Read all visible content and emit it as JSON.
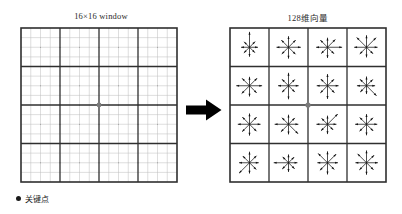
{
  "figure": {
    "title_left": "16×16 window",
    "title_right": "128维向量"
  },
  "legend": {
    "marker": "keypoint-dot",
    "label": "关键点"
  },
  "arrow": {
    "name": "transform-arrow",
    "direction": "right",
    "color": "#111111"
  },
  "colors": {
    "grid_fine": "#bdbdbd",
    "grid_block": "#2f2f2f",
    "panel_border": "#2f2f2f",
    "keypoint": "#7a7a7a",
    "ink": "#111111",
    "background": "#ffffff"
  },
  "window_grid": {
    "name": "16x16-sampling-window",
    "fine_cells": 16,
    "block_cells": 4,
    "keypoint": {
      "x": 0.5,
      "y": 0.5
    }
  },
  "descriptor_grid": {
    "name": "4x4-orientation-histogram-grid",
    "rows": 4,
    "cols": 4,
    "bins_per_cell": 8,
    "bin_angles_deg": [
      90,
      45,
      0,
      315,
      270,
      225,
      180,
      135
    ],
    "keypoint": {
      "x": 0.5,
      "y": 0.5
    },
    "cells": [
      {
        "row": 0,
        "col": 0,
        "magnitudes": [
          1.0,
          0.52,
          0.55,
          0.5,
          0.62,
          0.52,
          0.55,
          0.5
        ]
      },
      {
        "row": 0,
        "col": 1,
        "magnitudes": [
          0.72,
          0.66,
          0.8,
          0.64,
          0.74,
          0.62,
          0.78,
          0.66
        ]
      },
      {
        "row": 0,
        "col": 2,
        "magnitudes": [
          0.62,
          0.72,
          0.95,
          0.6,
          0.7,
          0.58,
          0.74,
          0.66
        ]
      },
      {
        "row": 0,
        "col": 3,
        "magnitudes": [
          0.78,
          0.88,
          0.72,
          0.6,
          0.66,
          0.62,
          0.8,
          0.9
        ]
      },
      {
        "row": 1,
        "col": 0,
        "magnitudes": [
          0.58,
          0.7,
          0.82,
          0.66,
          0.7,
          0.72,
          0.86,
          0.68
        ]
      },
      {
        "row": 1,
        "col": 1,
        "magnitudes": [
          0.84,
          0.58,
          0.66,
          0.58,
          0.88,
          0.6,
          0.68,
          0.6
        ]
      },
      {
        "row": 1,
        "col": 2,
        "magnitudes": [
          0.76,
          0.6,
          0.72,
          0.64,
          0.86,
          0.66,
          0.7,
          0.62
        ]
      },
      {
        "row": 1,
        "col": 3,
        "magnitudes": [
          0.6,
          0.58,
          0.56,
          0.92,
          0.54,
          0.58,
          0.62,
          0.6
        ]
      },
      {
        "row": 2,
        "col": 0,
        "magnitudes": [
          0.7,
          0.66,
          0.72,
          0.64,
          0.74,
          0.68,
          0.76,
          0.66
        ]
      },
      {
        "row": 2,
        "col": 1,
        "magnitudes": [
          0.62,
          0.58,
          0.64,
          0.88,
          0.66,
          0.7,
          0.9,
          0.6
        ]
      },
      {
        "row": 2,
        "col": 2,
        "magnitudes": [
          0.56,
          0.94,
          0.58,
          0.52,
          0.64,
          0.6,
          0.72,
          0.54
        ]
      },
      {
        "row": 2,
        "col": 3,
        "magnitudes": [
          0.66,
          0.6,
          0.7,
          0.62,
          0.72,
          0.64,
          0.74,
          0.62
        ]
      },
      {
        "row": 3,
        "col": 0,
        "magnitudes": [
          0.72,
          0.64,
          0.6,
          0.62,
          0.7,
          0.96,
          0.68,
          0.62
        ]
      },
      {
        "row": 3,
        "col": 1,
        "magnitudes": [
          0.54,
          0.52,
          0.58,
          0.56,
          0.6,
          0.58,
          0.96,
          0.54
        ]
      },
      {
        "row": 3,
        "col": 2,
        "magnitudes": [
          0.74,
          0.8,
          0.68,
          0.62,
          0.76,
          0.7,
          0.66,
          0.86
        ]
      },
      {
        "row": 3,
        "col": 3,
        "magnitudes": [
          0.8,
          0.7,
          0.74,
          0.64,
          0.78,
          0.66,
          0.72,
          0.82
        ]
      }
    ]
  }
}
